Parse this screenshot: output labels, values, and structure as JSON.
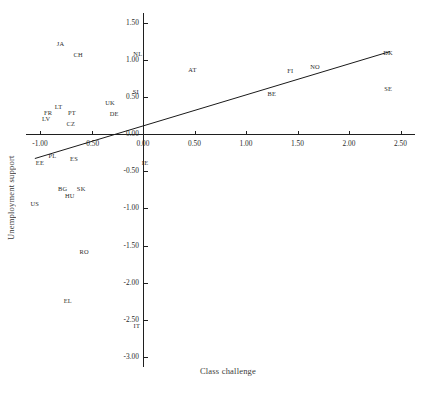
{
  "chart_data": {
    "type": "scatter",
    "title": "",
    "xlabel": "Class challenge",
    "ylabel": "Unemployment support",
    "xlim": [
      -1.25,
      2.62
    ],
    "ylim": [
      -3.0,
      1.5
    ],
    "xticks": [
      "-1.00",
      "-0.50",
      "0.00",
      "0.50",
      "1.00",
      "1.50",
      "2.00",
      "2.50"
    ],
    "xtick_values": [
      -1.0,
      -0.5,
      0.0,
      0.5,
      1.0,
      1.5,
      2.0,
      2.5
    ],
    "yticks": [
      "1.50",
      "1.00",
      "0.50",
      "0.00",
      "-0.50",
      "-1.00",
      "-1.50",
      "-2.00",
      "-2.50",
      "-3.00"
    ],
    "ytick_values": [
      1.5,
      1.0,
      0.5,
      0.0,
      -0.5,
      -1.0,
      -1.5,
      -2.0,
      -2.5,
      -3.0
    ],
    "grid": false,
    "legend": null,
    "marker_style": "text-label-only",
    "points": [
      {
        "label": "JA",
        "x": -0.8,
        "y": 1.22
      },
      {
        "label": "CH",
        "x": -0.63,
        "y": 1.08
      },
      {
        "label": "NL",
        "x": -0.05,
        "y": 1.09
      },
      {
        "label": "DK",
        "x": 2.38,
        "y": 1.1
      },
      {
        "label": "AT",
        "x": 0.48,
        "y": 0.87
      },
      {
        "label": "NO",
        "x": 1.67,
        "y": 0.91
      },
      {
        "label": "FI",
        "x": 1.43,
        "y": 0.86
      },
      {
        "label": "SE",
        "x": 2.38,
        "y": 0.62
      },
      {
        "label": "SI",
        "x": -0.07,
        "y": 0.58
      },
      {
        "label": "BE",
        "x": 1.25,
        "y": 0.55
      },
      {
        "label": "UK",
        "x": -0.32,
        "y": 0.43
      },
      {
        "label": "LT",
        "x": -0.82,
        "y": 0.38
      },
      {
        "label": "FR",
        "x": -0.92,
        "y": 0.3
      },
      {
        "label": "PT",
        "x": -0.69,
        "y": 0.29
      },
      {
        "label": "DE",
        "x": -0.28,
        "y": 0.28
      },
      {
        "label": "LV",
        "x": -0.94,
        "y": 0.21
      },
      {
        "label": "CZ",
        "x": -0.7,
        "y": 0.15
      },
      {
        "label": "IE",
        "x": 0.02,
        "y": -0.38
      },
      {
        "label": "PL",
        "x": -0.88,
        "y": -0.28
      },
      {
        "label": "ES",
        "x": -0.67,
        "y": -0.32
      },
      {
        "label": "EE",
        "x": -1.0,
        "y": -0.37
      },
      {
        "label": "BG",
        "x": -0.78,
        "y": -0.73
      },
      {
        "label": "SK",
        "x": -0.6,
        "y": -0.73
      },
      {
        "label": "HU",
        "x": -0.71,
        "y": -0.82
      },
      {
        "label": "US",
        "x": -1.05,
        "y": -0.93
      },
      {
        "label": "RO",
        "x": -0.57,
        "y": -1.58
      },
      {
        "label": "EL",
        "x": -0.73,
        "y": -2.23
      },
      {
        "label": "IT",
        "x": -0.06,
        "y": -2.57
      }
    ],
    "fit_line": {
      "type": "linear-regression",
      "x_start": -1.05,
      "y_start": -0.33,
      "x_end": 2.4,
      "y_end": 1.11
    }
  }
}
